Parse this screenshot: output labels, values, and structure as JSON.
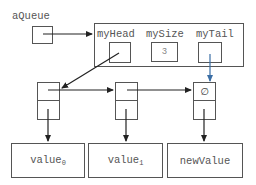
{
  "diagram": {
    "variable_label": "aQueue",
    "queue": {
      "fields": [
        {
          "name": "myHead",
          "value": ""
        },
        {
          "name": "mySize",
          "value": "3"
        },
        {
          "name": "myTail",
          "value": ""
        }
      ]
    },
    "nodes": [
      {
        "next": "node-2",
        "data_label": "value",
        "data_sub": "0"
      },
      {
        "next": "node-3",
        "data_label": "value",
        "data_sub": "1"
      },
      {
        "next_symbol": "∅",
        "data_label": "newValue",
        "data_sub": ""
      }
    ],
    "colors": {
      "line": "#333333",
      "box_border": "#555555",
      "tail_arrow": "#3a6ea5"
    }
  }
}
